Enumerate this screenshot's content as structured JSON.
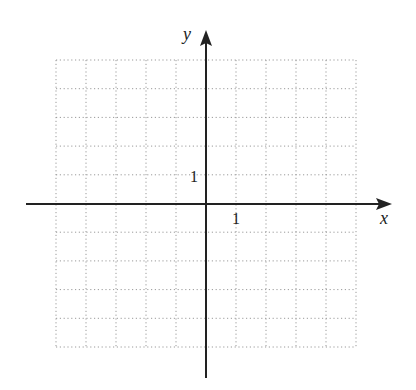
{
  "diagram": {
    "type": "coordinate-grid",
    "x_axis_label": "x",
    "y_axis_label": "y",
    "x_tick_label": "1",
    "y_tick_label": "1",
    "grid": {
      "x_range": [
        -5,
        5
      ],
      "y_range": [
        -5,
        5
      ],
      "cell_px_x": 30,
      "cell_px_y": 28.7,
      "line_style": "dotted",
      "line_color": "#9a9a9a"
    },
    "axis_color": "#222222"
  }
}
